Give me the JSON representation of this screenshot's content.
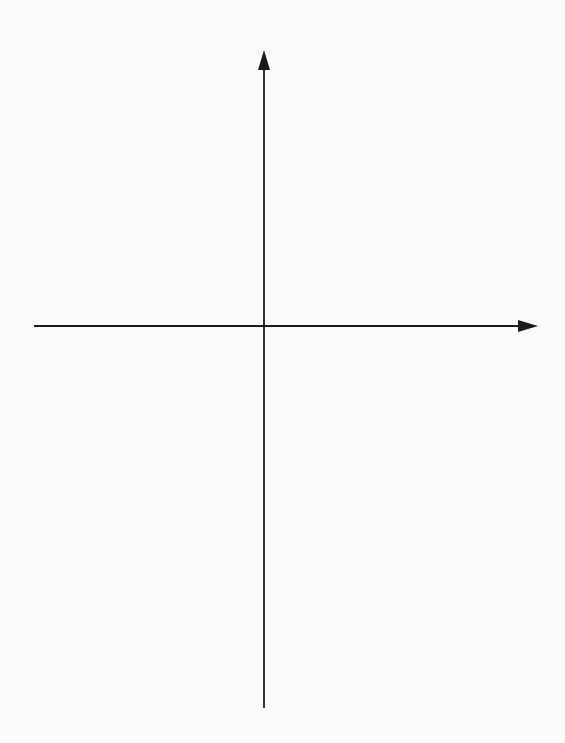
{
  "axes": {
    "y_label": "f(x)",
    "x_label": "x",
    "x_range": [
      -5,
      6
    ],
    "y_range": [
      -8,
      6
    ],
    "grid": true
  },
  "colors": {
    "background": "#fbfbfa",
    "grid": "#b5b5b5",
    "lines": "#2a2a2a"
  },
  "lines": [
    {
      "label": "f1",
      "slope": 1,
      "intercept": 3
    },
    {
      "label": "f2",
      "slope": 1,
      "intercept": 2
    },
    {
      "label": "f3",
      "slope": 1,
      "intercept": 1
    },
    {
      "label": "f4",
      "slope": 1,
      "intercept": 0
    },
    {
      "label": "f5",
      "slope": 1,
      "intercept": -1
    },
    {
      "label": "f6",
      "slope": 1,
      "intercept": -2
    },
    {
      "label": "f7",
      "slope": 1,
      "intercept": -3
    }
  ],
  "chart_data": {
    "type": "line",
    "title": "",
    "xlabel": "x",
    "ylabel": "f(x)",
    "grid": true,
    "xlim": [
      -5.2,
      6.3
    ],
    "ylim": [
      -8.5,
      6.2
    ],
    "series": [
      {
        "name": "f1",
        "equation": "f(x) = x + 3",
        "points": [
          [
            -5.2,
            -2.2
          ],
          [
            3.3,
            6.3
          ]
        ]
      },
      {
        "name": "f2",
        "equation": "f(x) = x + 2",
        "points": [
          [
            -5.2,
            -3.2
          ],
          [
            4.3,
            6.3
          ]
        ]
      },
      {
        "name": "f3",
        "equation": "f(x) = x + 1",
        "points": [
          [
            -5.2,
            -4.2
          ],
          [
            5.3,
            6.3
          ]
        ]
      },
      {
        "name": "f4",
        "equation": "f(x) = x",
        "points": [
          [
            -5.2,
            -5.2
          ],
          [
            6.2,
            6.2
          ]
        ]
      },
      {
        "name": "f5",
        "equation": "f(x) = x - 1",
        "points": [
          [
            -5.2,
            -6.2
          ],
          [
            6.2,
            5.2
          ]
        ]
      },
      {
        "name": "f6",
        "equation": "f(x) = x - 2",
        "points": [
          [
            -5.2,
            -7.2
          ],
          [
            6.2,
            4.2
          ]
        ]
      },
      {
        "name": "f7",
        "equation": "f(x) = x - 3",
        "points": [
          [
            -5.2,
            -8.2
          ],
          [
            6.2,
            3.2
          ]
        ]
      }
    ]
  }
}
